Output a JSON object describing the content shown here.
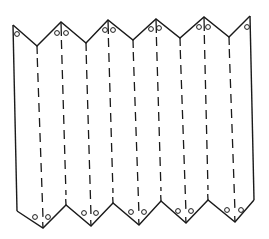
{
  "figure": {
    "colors": {
      "stroke": "#1a1a1a",
      "background": "#ffffff"
    },
    "top_edge": [
      [
        13,
        25
      ],
      [
        37,
        46
      ],
      [
        61,
        22
      ],
      [
        86,
        43
      ],
      [
        108,
        20
      ],
      [
        133,
        40
      ],
      [
        156,
        19
      ],
      [
        180,
        38
      ],
      [
        204,
        17
      ],
      [
        229,
        37
      ],
      [
        250,
        16
      ]
    ],
    "bottom_edge": [
      [
        17,
        211
      ],
      [
        43,
        228
      ],
      [
        66,
        205
      ],
      [
        91,
        226
      ],
      [
        113,
        203
      ],
      [
        139,
        225
      ],
      [
        161,
        201
      ],
      [
        186,
        223
      ],
      [
        208,
        200
      ],
      [
        235,
        222
      ],
      [
        254,
        200
      ]
    ],
    "left_edge": [
      [
        13,
        25
      ],
      [
        17,
        211
      ]
    ],
    "right_edge": [
      [
        250,
        16
      ],
      [
        254,
        200
      ]
    ],
    "fold_lines": [
      {
        "x1": 37,
        "y1": 46,
        "x2": 43,
        "y2": 228,
        "solid_top": 8
      },
      {
        "x1": 61,
        "y1": 22,
        "x2": 66,
        "y2": 205,
        "solid_top": 14
      },
      {
        "x1": 86,
        "y1": 43,
        "x2": 91,
        "y2": 226,
        "solid_top": 8
      },
      {
        "x1": 108,
        "y1": 20,
        "x2": 113,
        "y2": 203,
        "solid_top": 14
      },
      {
        "x1": 133,
        "y1": 40,
        "x2": 139,
        "y2": 225,
        "solid_top": 8
      },
      {
        "x1": 156,
        "y1": 19,
        "x2": 161,
        "y2": 201,
        "solid_top": 14
      },
      {
        "x1": 180,
        "y1": 38,
        "x2": 186,
        "y2": 223,
        "solid_top": 8
      },
      {
        "x1": 204,
        "y1": 17,
        "x2": 208,
        "y2": 200,
        "solid_top": 14
      },
      {
        "x1": 229,
        "y1": 37,
        "x2": 235,
        "y2": 222,
        "solid_top": 8
      }
    ],
    "circles": [
      [
        17,
        34
      ],
      [
        57,
        33
      ],
      [
        66,
        33
      ],
      [
        105,
        30
      ],
      [
        113,
        30
      ],
      [
        151,
        29
      ],
      [
        159,
        28
      ],
      [
        199,
        27
      ],
      [
        208,
        27
      ],
      [
        247,
        27
      ],
      [
        35,
        217
      ],
      [
        48,
        217
      ],
      [
        84,
        213
      ],
      [
        96,
        213
      ],
      [
        131,
        212
      ],
      [
        144,
        212
      ],
      [
        178,
        211
      ],
      [
        191,
        211
      ],
      [
        227,
        210
      ],
      [
        241,
        210
      ]
    ]
  }
}
